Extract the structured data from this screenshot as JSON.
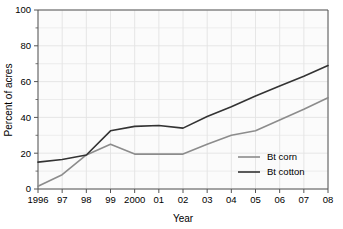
{
  "chart_data": {
    "type": "line",
    "title": "",
    "xlabel": "Year",
    "ylabel": "Percent of acres",
    "categories": [
      "1996",
      "97",
      "98",
      "99",
      "2000",
      "01",
      "02",
      "03",
      "04",
      "05",
      "06",
      "07",
      "08"
    ],
    "x": [
      1996,
      1997,
      1998,
      1999,
      2000,
      2001,
      2002,
      2003,
      2004,
      2005,
      2006,
      2007,
      2008
    ],
    "xlim": [
      1996,
      2008
    ],
    "ylim": [
      0,
      100
    ],
    "yticks": [
      0,
      20,
      40,
      60,
      80,
      100
    ],
    "ytick_labels": [
      "0",
      "20",
      "40",
      "60",
      "80",
      "100"
    ],
    "grid": true,
    "legend_position": "lower right",
    "series": [
      {
        "name": "Bt corn",
        "color": "#8c8c8c",
        "values": [
          1.5,
          8,
          19,
          25,
          19.5,
          19.5,
          19.5,
          25,
          30,
          32.5,
          38.5,
          44.5,
          51
        ]
      },
      {
        "name": "Bt cotton",
        "color": "#333333",
        "values": [
          15,
          16.5,
          19,
          32.5,
          35,
          35.5,
          34,
          40.5,
          46,
          52,
          57.5,
          63,
          69
        ]
      }
    ]
  },
  "axes": {
    "y_title": "Percent of acres",
    "x_title": "Year"
  },
  "legend": {
    "entries": [
      {
        "label": "Bt corn"
      },
      {
        "label": "Bt cotton"
      }
    ]
  },
  "colors": {
    "bt_corn": "#8c8c8c",
    "bt_cotton": "#333333",
    "grid": "#e3e3e3",
    "axis": "#555555",
    "plot_background": "#fbfbfb"
  }
}
